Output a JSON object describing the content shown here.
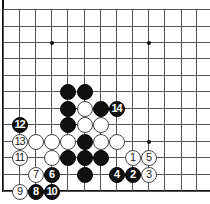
{
  "board": {
    "x_lines": [
      3,
      19,
      35,
      51,
      67,
      84,
      100,
      116,
      132,
      148,
      164,
      181,
      196
    ],
    "y_lines": [
      9,
      26,
      42,
      58,
      75,
      91,
      108,
      124,
      141,
      157,
      174,
      191
    ],
    "star_points": [
      [
        3,
        2
      ],
      [
        9,
        2
      ],
      [
        3,
        8
      ],
      [
        9,
        8
      ]
    ],
    "colors": {
      "black": "#111111",
      "white": "#ffffff",
      "line": "#555555"
    }
  },
  "stones": [
    {
      "col": 4,
      "row": 5,
      "color": "black",
      "label": ""
    },
    {
      "col": 5,
      "row": 5,
      "color": "black",
      "label": ""
    },
    {
      "col": 4,
      "row": 6,
      "color": "black",
      "label": ""
    },
    {
      "col": 5,
      "row": 6,
      "color": "white",
      "label": ""
    },
    {
      "col": 6,
      "row": 6,
      "color": "black",
      "label": ""
    },
    {
      "col": 7,
      "row": 6,
      "color": "black",
      "label": "14"
    },
    {
      "col": 1,
      "row": 7,
      "color": "black",
      "label": "12"
    },
    {
      "col": 4,
      "row": 7,
      "color": "black",
      "label": ""
    },
    {
      "col": 5,
      "row": 7,
      "color": "white",
      "label": ""
    },
    {
      "col": 6,
      "row": 7,
      "color": "white",
      "label": ""
    },
    {
      "col": 1,
      "row": 8,
      "color": "white",
      "label": "13"
    },
    {
      "col": 2,
      "row": 8,
      "color": "white",
      "label": ""
    },
    {
      "col": 3,
      "row": 8,
      "color": "white",
      "label": ""
    },
    {
      "col": 4,
      "row": 8,
      "color": "white",
      "label": ""
    },
    {
      "col": 5,
      "row": 8,
      "color": "black",
      "label": ""
    },
    {
      "col": 6,
      "row": 8,
      "color": "white",
      "label": ""
    },
    {
      "col": 7,
      "row": 8,
      "color": "white",
      "label": ""
    },
    {
      "col": 1,
      "row": 9,
      "color": "white",
      "label": "11"
    },
    {
      "col": 3,
      "row": 9,
      "color": "white",
      "label": ""
    },
    {
      "col": 4,
      "row": 9,
      "color": "black",
      "label": ""
    },
    {
      "col": 5,
      "row": 9,
      "color": "black",
      "label": ""
    },
    {
      "col": 6,
      "row": 9,
      "color": "black",
      "label": ""
    },
    {
      "col": 8,
      "row": 9,
      "color": "white",
      "label": "1"
    },
    {
      "col": 9,
      "row": 9,
      "color": "white",
      "label": "5"
    },
    {
      "col": 2,
      "row": 10,
      "color": "white",
      "label": "7"
    },
    {
      "col": 3,
      "row": 10,
      "color": "black",
      "label": "6"
    },
    {
      "col": 5,
      "row": 10,
      "color": "black",
      "label": ""
    },
    {
      "col": 7,
      "row": 10,
      "color": "black",
      "label": "4"
    },
    {
      "col": 8,
      "row": 10,
      "color": "black",
      "label": "2"
    },
    {
      "col": 9,
      "row": 10,
      "color": "white",
      "label": "3"
    },
    {
      "col": 1,
      "row": 11,
      "color": "white",
      "label": "9"
    },
    {
      "col": 2,
      "row": 11,
      "color": "black",
      "label": "8"
    },
    {
      "col": 3,
      "row": 11,
      "color": "black",
      "label": "10"
    }
  ]
}
